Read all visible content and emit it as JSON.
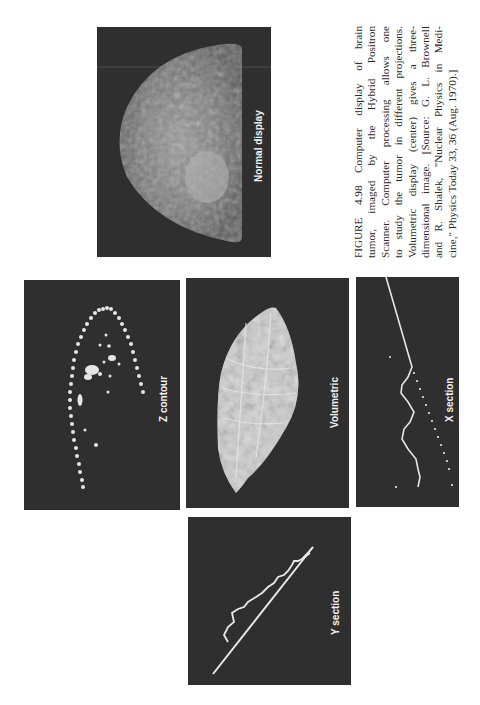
{
  "figure": {
    "number": "FIGURE 4.98",
    "caption_lines": [
      "FIGURE 4.98  Computer display of brain",
      "tumor, imaged by the Hybrid Positron",
      "Scanner. Computer processing allows one",
      "to study the tumor in different projections.",
      "Volumetric display (center) gives a three-",
      "dimensional image. [Source: G. L. Brownell",
      "and R. Shalek, \"Nuclear Physics in Medi-",
      "cine,\" Physics Today 33, 36 (Aug. 1970).]"
    ],
    "orientation": "rotated 90° counterclockwise"
  },
  "panels": {
    "normal_display": {
      "label": "Normal display"
    },
    "z_contour": {
      "label": "Z contour"
    },
    "volumetric": {
      "label": "Volumetric"
    },
    "x_section": {
      "label": "X section"
    },
    "y_section": {
      "label": "Y section"
    }
  },
  "colors": {
    "page": "#ffffff",
    "panel": "#2f2f2f",
    "trace": "#e8e8e8",
    "text": "#2a2a2a"
  }
}
